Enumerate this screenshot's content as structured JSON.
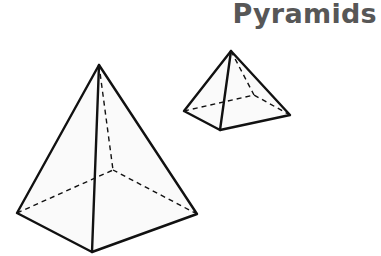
{
  "title": "Pyramids",
  "colors": {
    "title": "#575757",
    "edge": "#111111",
    "face": "#fafafa"
  },
  "shapes": [
    {
      "name": "large-square-pyramid",
      "apex": [
        99,
        65
      ],
      "base_visible": [
        [
          17,
          213
        ],
        [
          92,
          252
        ],
        [
          197,
          214
        ]
      ],
      "base_hidden": [
        113,
        170
      ]
    },
    {
      "name": "small-square-pyramid",
      "apex": [
        231,
        51
      ],
      "base_visible": [
        [
          184,
          111
        ],
        [
          220,
          130
        ],
        [
          290,
          115
        ]
      ],
      "base_hidden": [
        254,
        95
      ]
    }
  ]
}
